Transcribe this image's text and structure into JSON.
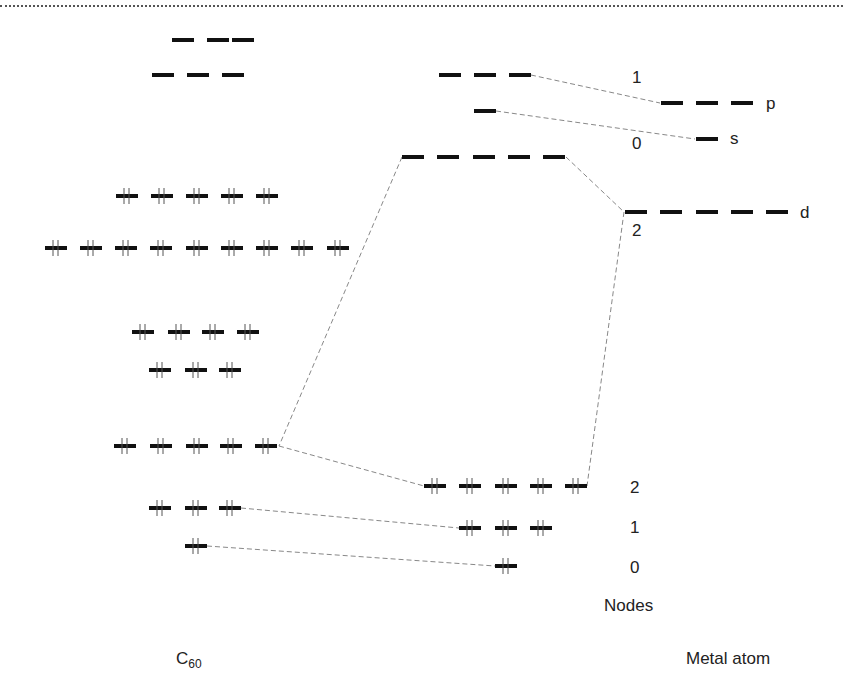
{
  "labels": {
    "c60": "C",
    "c60_sub": "60",
    "metal_atom": "Metal atom",
    "nodes": "Nodes",
    "metal_p": "p",
    "metal_s": "s",
    "metal_d": "d",
    "node_1_upper": "1",
    "node_0_upper": "0",
    "node_2_upper": "2",
    "node_2_lower": "2",
    "node_1_lower": "1",
    "node_0_lower": "0"
  },
  "colors": {
    "level": "#111111",
    "connector": "#888888",
    "electron": "#555555",
    "text": "#222222"
  },
  "levels": {
    "c60": [
      {
        "y": 40,
        "xs": [
          172,
          207,
          232
        ],
        "w": 22,
        "filled": false,
        "xs_full": [
          152,
          187,
          222
        ]
      },
      {
        "y": 75,
        "filled": false,
        "xs": [
          152,
          187,
          222
        ]
      },
      {
        "y": 196,
        "filled": true,
        "xs": [
          116,
          151,
          186,
          221,
          256
        ]
      },
      {
        "y": 248,
        "filled": true,
        "xs": [
          45,
          80,
          115,
          150,
          186,
          221,
          256,
          291,
          327
        ]
      },
      {
        "y": 332,
        "filled": true,
        "xs": [
          132,
          168,
          202,
          237
        ]
      },
      {
        "y": 370,
        "filled": true,
        "xs": [
          149,
          185,
          219
        ]
      },
      {
        "y": 446,
        "filled": true,
        "xs": [
          114,
          150,
          186,
          220,
          255
        ]
      },
      {
        "y": 508,
        "filled": true,
        "xs": [
          149,
          185,
          219
        ]
      },
      {
        "y": 546,
        "filled": true,
        "xs": [
          185
        ]
      }
    ],
    "complex": [
      {
        "y": 75,
        "filled": false,
        "xs": [
          439,
          474,
          509
        ]
      },
      {
        "y": 111,
        "filled": false,
        "xs": [
          474
        ]
      },
      {
        "y": 157,
        "filled": false,
        "xs": [
          402,
          437,
          473,
          508,
          543
        ]
      },
      {
        "y": 486,
        "filled": true,
        "xs": [
          424,
          459,
          495,
          530,
          565
        ]
      },
      {
        "y": 528,
        "filled": true,
        "xs": [
          459,
          495,
          530
        ]
      },
      {
        "y": 566,
        "filled": true,
        "xs": [
          495
        ]
      }
    ],
    "metal": [
      {
        "y": 103,
        "filled": false,
        "xs": [
          661,
          696,
          731
        ],
        "name": "p"
      },
      {
        "y": 139,
        "filled": false,
        "xs": [
          696
        ],
        "name": "s"
      },
      {
        "y": 212,
        "filled": false,
        "xs": [
          625,
          660,
          696,
          731,
          766
        ],
        "name": "d"
      }
    ]
  },
  "connectors": [
    {
      "from": [
        531,
        75
      ],
      "to": [
        660,
        103
      ]
    },
    {
      "from": [
        496,
        111
      ],
      "to": [
        695,
        139
      ]
    },
    {
      "from": [
        566,
        157
      ],
      "to": [
        624,
        212
      ]
    },
    {
      "from": [
        624,
        212
      ],
      "to": [
        587,
        486
      ]
    },
    {
      "from": [
        402,
        157
      ],
      "to": [
        279,
        446
      ]
    },
    {
      "from": [
        279,
        446
      ],
      "to": [
        424,
        486
      ]
    },
    {
      "from": [
        241,
        508
      ],
      "to": [
        459,
        528
      ]
    },
    {
      "from": [
        207,
        546
      ],
      "to": [
        495,
        566
      ]
    }
  ]
}
